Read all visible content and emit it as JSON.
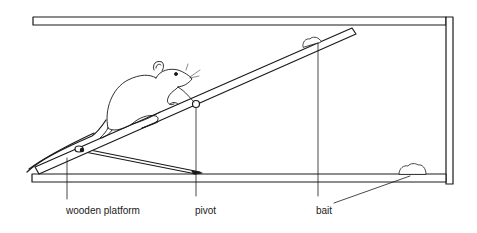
{
  "diagram": {
    "type": "apparatus-illustration",
    "colors": {
      "ink": "#1a1a1a",
      "background": "#ffffff"
    },
    "labels": [
      {
        "id": "wooden-platform",
        "text": "wooden platform"
      },
      {
        "id": "pivot",
        "text": "pivot"
      },
      {
        "id": "bait",
        "text": "bait"
      }
    ],
    "parts": [
      "top-rail",
      "right-wall",
      "bottom-rail",
      "wooden-platform",
      "pivot",
      "support-strut",
      "mouse",
      "bait-top",
      "bait-bottom"
    ]
  }
}
